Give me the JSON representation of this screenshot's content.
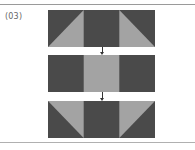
{
  "figure": {
    "label": "(03)",
    "colors": {
      "dark": "#4a4a4a",
      "light": "#a3a3a3",
      "arrow": "#333333",
      "rule": "#9a9a9a"
    },
    "steps": [
      {
        "name": "step-1",
        "description": "Dark block with light triangles pointing up toward center on left and right thirds"
      },
      {
        "name": "step-2",
        "description": "Dark block with light center square"
      },
      {
        "name": "step-3",
        "description": "Dark block with light triangles pointing down toward center on left and right thirds"
      }
    ]
  }
}
